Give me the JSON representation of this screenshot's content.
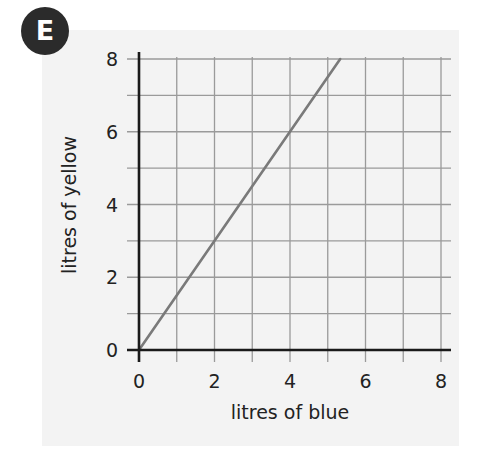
{
  "badge": {
    "label": "E"
  },
  "chart_data": {
    "type": "line",
    "title": "",
    "xlabel": "litres of blue",
    "ylabel": "litres of yellow",
    "xlim": [
      0,
      8
    ],
    "ylim": [
      0,
      8
    ],
    "x_ticks": [
      0,
      2,
      4,
      6,
      8
    ],
    "y_ticks": [
      0,
      2,
      4,
      6,
      8
    ],
    "grid": true,
    "grid_step": 1,
    "series": [
      {
        "name": "yellow vs blue",
        "x": [
          0,
          5.33
        ],
        "y": [
          0,
          8
        ],
        "color": "#7a7a7a"
      }
    ],
    "colors": {
      "axis": "#1a1a1a",
      "grid": "#9a9a9a",
      "line": "#7a7a7a",
      "panel": "#f3f3f3"
    }
  }
}
